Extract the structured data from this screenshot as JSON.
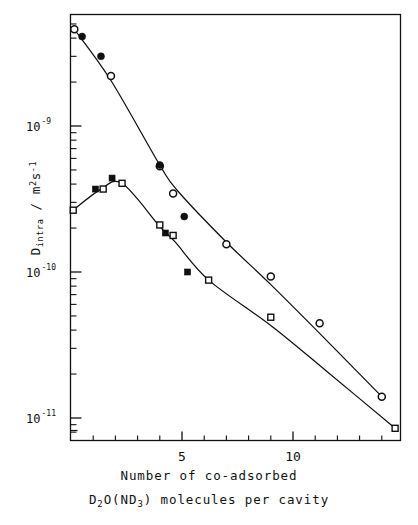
{
  "figure": {
    "background_color": "#ffffff",
    "ink_color": "#101010"
  },
  "axes": {
    "y_title_main": "D",
    "y_title_sub": "intra",
    "y_title_slash": " / ",
    "y_title_unit_m": "m",
    "y_title_unit_m_exp": "2",
    "y_title_unit_s": "s",
    "y_title_unit_s_exp": "-1",
    "x_caption_line1": "Number of co-adsorbed",
    "x_caption_line2_a": "D",
    "x_caption_line2_a_sub": "2",
    "x_caption_line2_b": "O(ND",
    "x_caption_line2_b_sub": "3",
    "x_caption_line2_c": ") molecules per cavity"
  },
  "chart_data": {
    "type": "scatter",
    "title": "",
    "xlabel": "Number of co-adsorbed D2O(ND3) molecules per cavity",
    "ylabel": "D_intra / m2 s-1",
    "xscale": "linear",
    "yscale": "log",
    "xlim": [
      0,
      15
    ],
    "ylim": [
      7e-12,
      6.5e-09
    ],
    "grid": false,
    "legend": "none",
    "x_ticks_major": [
      5,
      10
    ],
    "x_tick_labels": [
      "5",
      "10"
    ],
    "x_ticks_minor": [
      1,
      2,
      3,
      4,
      6,
      7,
      8,
      9,
      11,
      12,
      13,
      14
    ],
    "y_ticks_major": [
      1e-09,
      1e-10,
      1e-11
    ],
    "y_tick_labels": [
      "10-9",
      "10-10",
      "10-11"
    ],
    "y_tick_label_mantissa": "10",
    "y_tick_label_exponents": [
      "-9",
      "-10",
      "-11"
    ],
    "series": [
      {
        "name": "open-circles",
        "marker": "open-circle",
        "marker_size": 7,
        "points": [
          {
            "x": 0.15,
            "y": 4.6e-09
          },
          {
            "x": 1.8,
            "y": 2.2e-09
          },
          {
            "x": 4.0,
            "y": 5.3e-10
          },
          {
            "x": 4.6,
            "y": 3.45e-10
          },
          {
            "x": 7.0,
            "y": 1.55e-10
          },
          {
            "x": 9.0,
            "y": 9.3e-11
          },
          {
            "x": 11.2,
            "y": 4.45e-11
          },
          {
            "x": 14.0,
            "y": 1.4e-11
          }
        ]
      },
      {
        "name": "filled-circles",
        "marker": "filled-circle",
        "marker_size": 7,
        "points": [
          {
            "x": 0.5,
            "y": 4.1e-09
          },
          {
            "x": 1.35,
            "y": 3e-09
          },
          {
            "x": 4.0,
            "y": 5.4e-10
          },
          {
            "x": 5.1,
            "y": 2.4e-10
          }
        ]
      },
      {
        "name": "open-squares",
        "marker": "open-square",
        "marker_size": 6,
        "points": [
          {
            "x": 0.1,
            "y": 2.65e-10
          },
          {
            "x": 1.45,
            "y": 3.7e-10
          },
          {
            "x": 2.3,
            "y": 4.05e-10
          },
          {
            "x": 4.0,
            "y": 2.1e-10
          },
          {
            "x": 4.6,
            "y": 1.78e-10
          },
          {
            "x": 6.2,
            "y": 8.8e-11
          },
          {
            "x": 9.0,
            "y": 4.9e-11
          },
          {
            "x": 14.6,
            "y": 8.5e-12
          }
        ]
      },
      {
        "name": "filled-squares",
        "marker": "filled-square",
        "marker_size": 6,
        "points": [
          {
            "x": 1.1,
            "y": 3.7e-10
          },
          {
            "x": 1.85,
            "y": 4.4e-10
          },
          {
            "x": 4.25,
            "y": 1.85e-10
          },
          {
            "x": 5.25,
            "y": 1e-10
          }
        ]
      }
    ],
    "fit_curves": [
      {
        "name": "upper-curve",
        "points": [
          {
            "x": 0.15,
            "y": 4.6e-09
          },
          {
            "x": 1.8,
            "y": 2.05e-09
          },
          {
            "x": 4.0,
            "y": 5.4e-10
          },
          {
            "x": 4.8,
            "y": 3.6e-10
          },
          {
            "x": 7.0,
            "y": 1.6e-10
          },
          {
            "x": 9.0,
            "y": 8.2e-11
          },
          {
            "x": 11.2,
            "y": 3.8e-11
          },
          {
            "x": 14.0,
            "y": 1.4e-11
          }
        ]
      },
      {
        "name": "lower-curve",
        "points": [
          {
            "x": 0.1,
            "y": 2.65e-10
          },
          {
            "x": 1.3,
            "y": 3.65e-10
          },
          {
            "x": 2.3,
            "y": 4.05e-10
          },
          {
            "x": 4.0,
            "y": 2.05e-10
          },
          {
            "x": 4.7,
            "y": 1.6e-10
          },
          {
            "x": 6.2,
            "y": 8.8e-11
          },
          {
            "x": 9.0,
            "y": 4.3e-11
          },
          {
            "x": 11.5,
            "y": 2.1e-11
          },
          {
            "x": 14.6,
            "y": 8.5e-12
          }
        ]
      }
    ]
  }
}
